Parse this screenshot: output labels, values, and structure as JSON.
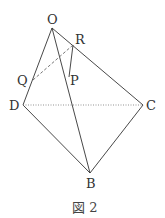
{
  "diagram": {
    "caption": "図 2",
    "colors": {
      "line": "#333333",
      "hidden": "#666666",
      "background": "#ffffff"
    },
    "points": {
      "O": {
        "label": "O",
        "x": 52,
        "y": 28
      },
      "R": {
        "label": "R",
        "x": 73,
        "y": 45
      },
      "Q": {
        "label": "Q",
        "x": 33,
        "y": 80
      },
      "P": {
        "label": "P",
        "x": 69,
        "y": 77
      },
      "D": {
        "label": "D",
        "x": 23,
        "y": 105
      },
      "C": {
        "label": "C",
        "x": 143,
        "y": 105
      },
      "B": {
        "label": "B",
        "x": 90,
        "y": 173
      }
    },
    "solid_edges": [
      "O-D",
      "O-B",
      "O-C",
      "D-B",
      "C-B",
      "R-P"
    ],
    "dashed_edges": [
      "Q-R"
    ],
    "dotted_edges": [
      "D-C"
    ]
  }
}
